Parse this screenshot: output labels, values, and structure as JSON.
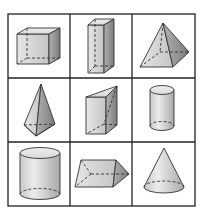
{
  "diagram": {
    "rows": 3,
    "cols": 3,
    "grid_line_color": "#222222",
    "shape_fill": "#d9d9d9",
    "shape_shade": "#9a9a9a",
    "cells": [
      {
        "row": 0,
        "col": 0,
        "shape": "cube"
      },
      {
        "row": 0,
        "col": 1,
        "shape": "rectangular-prism"
      },
      {
        "row": 0,
        "col": 2,
        "shape": "square-pyramid"
      },
      {
        "row": 1,
        "col": 0,
        "shape": "triangular-pyramid"
      },
      {
        "row": 1,
        "col": 1,
        "shape": "triangular-prism-upright"
      },
      {
        "row": 1,
        "col": 2,
        "shape": "cylinder-narrow"
      },
      {
        "row": 2,
        "col": 0,
        "shape": "cylinder-wide"
      },
      {
        "row": 2,
        "col": 1,
        "shape": "triangular-prism-horizontal"
      },
      {
        "row": 2,
        "col": 2,
        "shape": "cone"
      }
    ]
  }
}
